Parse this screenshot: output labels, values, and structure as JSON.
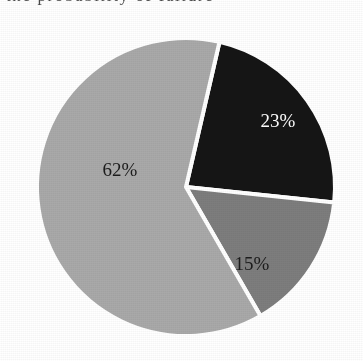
{
  "page": {
    "background_color": "#ffffff",
    "clipped_header_text": "the probability of failure"
  },
  "chart_data": {
    "type": "pie",
    "title": "",
    "subtitle": "",
    "xlabel": "",
    "ylabel": "",
    "grid": false,
    "legend_position": "none",
    "value_unit": "%",
    "total": 100,
    "start_angle_deg": 13,
    "direction": "clockwise",
    "center": {
      "x": 186,
      "y": 187
    },
    "radius": 149,
    "separator_color": "#ffffff",
    "separator_width": 4,
    "categories": [
      "Slice 1",
      "Slice 2",
      "Slice 3"
    ],
    "values": [
      23,
      15,
      62
    ],
    "labels": [
      "23%",
      "15%",
      "62%"
    ],
    "colors": [
      "#151515",
      "#7d7d7d",
      "#a9a9a9"
    ],
    "slices": [
      {
        "label": "23%",
        "value": 23,
        "color": "#151515",
        "label_color": "#ffffff",
        "start_deg": 13,
        "end_deg": 96,
        "label_x": 278,
        "label_y": 123
      },
      {
        "label": "15%",
        "value": 15,
        "color": "#7d7d7d",
        "label_color": "#1c1c1c",
        "start_deg": 96,
        "end_deg": 150,
        "label_x": 252,
        "label_y": 266
      },
      {
        "label": "62%",
        "value": 62,
        "color": "#a9a9a9",
        "label_color": "#1c1c1c",
        "start_deg": 150,
        "end_deg": 373,
        "label_x": 120,
        "label_y": 172
      }
    ]
  }
}
